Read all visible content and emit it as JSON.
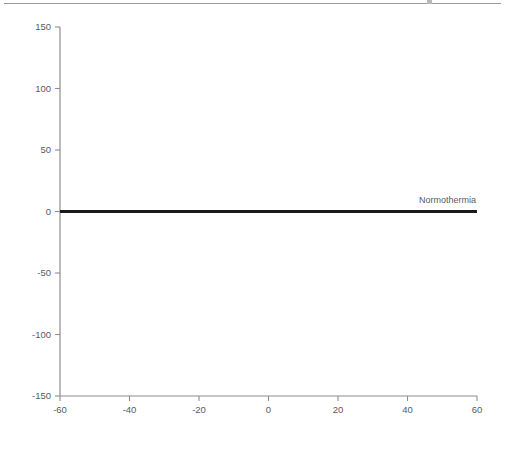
{
  "figure": {
    "background_color": "#ffffff",
    "axis_color": "#8d8d90",
    "text_color": "#5a5a5c",
    "series_color": "#a7a7aa",
    "reference_color": "#1a1a1a"
  },
  "chart_data": {
    "type": "line",
    "title": "",
    "subtitle": "",
    "xlabel": "Voltage [mV]",
    "ylabel": "% Current change",
    "xlim": [
      -60,
      60
    ],
    "ylim": [
      -150,
      150
    ],
    "xticks": [
      -60,
      -40,
      -20,
      0,
      20,
      40,
      60
    ],
    "xtick_labels": [
      "-60",
      "-40",
      "-20",
      "0",
      "20",
      "40",
      "60"
    ],
    "yticks": [
      150,
      100,
      50,
      0,
      -50,
      -100,
      -150
    ],
    "ytick_labels": [
      "150",
      "100",
      "50",
      "0",
      "-50",
      "-100",
      "-150"
    ],
    "grid": false,
    "legend_position": "none",
    "x": [
      -60,
      -50,
      -40,
      -30,
      -20,
      -10,
      0,
      10,
      20,
      30,
      40,
      50,
      60
    ],
    "series": [
      {
        "name": "Hypothermia % current change",
        "marker": "diamond",
        "linestyle": "dotted",
        "color": "#a7a7aa",
        "values": [
          64,
          64,
          61,
          47,
          16,
          -33,
          -66,
          -65,
          -64,
          -62,
          -58,
          -55,
          -53
        ],
        "err_upper": [
          17,
          18,
          16,
          41,
          79,
          87,
          33,
          32,
          31,
          27,
          25,
          30,
          30
        ],
        "err_lower": [
          18,
          17,
          14,
          39,
          80,
          86,
          32,
          27,
          28,
          29,
          30,
          30,
          28
        ]
      }
    ],
    "reference_lines": [
      {
        "name": "Normothermia",
        "label": "Normothermia",
        "orientation": "horizontal",
        "y": 0,
        "color": "#1a1a1a",
        "linewidth": 3,
        "label_x": 34,
        "label_y": 6
      }
    ]
  },
  "axes": {
    "x_axis_name": "voltage-axis",
    "y_axis_name": "current-change-axis"
  }
}
